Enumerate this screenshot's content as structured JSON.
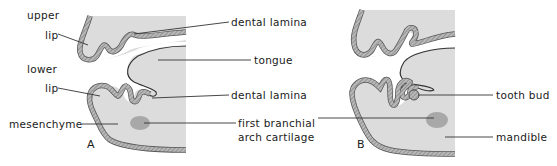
{
  "figure": {
    "panels": [
      {
        "id": "A",
        "letter": "A",
        "labels": {
          "upper": "upper",
          "upper_lip": "lip",
          "lower": "lower",
          "lower_lip": "lip",
          "mesenchyme": "mesenchyme",
          "dental_lamina_top": "dental lamina",
          "tongue": "tongue",
          "dental_lamina_bottom": "dental lamina",
          "cartilage_line1": "first branchial",
          "cartilage_line2": "arch cartilage"
        }
      },
      {
        "id": "B",
        "letter": "B",
        "labels": {
          "tooth_bud": "tooth bud",
          "mandible": "mandible"
        }
      }
    ],
    "colors": {
      "tissue_fill": "#d9d9d9",
      "epithelium": "#9a9a9a",
      "cartilage": "#a8a8a8",
      "line": "#333333",
      "background": "#ffffff"
    }
  }
}
